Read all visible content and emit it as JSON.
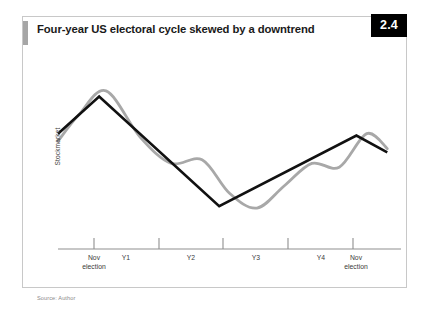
{
  "figure": {
    "number": "2.4",
    "title": "Four-year US electoral cycle skewed by a downtrend",
    "source": "Source: Author",
    "accent_color": "#a6a6a6",
    "badge_bg": "#000000",
    "badge_text_color": "#ffffff",
    "border_color": "#c8c8c8"
  },
  "chart_data": {
    "type": "line",
    "title": "Four-year US electoral cycle skewed by a downtrend",
    "xlabel": "",
    "ylabel": "Stockmarket",
    "grid": false,
    "legend": "none",
    "axis": {
      "x_axis_visible": true,
      "y_axis_visible": false,
      "tick_direction": "up",
      "tick_labels": [
        "Nov\nelection",
        "Y1",
        "Y2",
        "Y3",
        "Y4",
        "Nov\nelection"
      ],
      "tick_x_positions": [
        93,
        125,
        190,
        255,
        320,
        355
      ],
      "tick_mark_positions": [
        93,
        158,
        222,
        287,
        352
      ],
      "xlim": [
        0,
        100
      ],
      "ylim": [
        0,
        100
      ]
    },
    "series": [
      {
        "name": "Underlying trend",
        "color": "#111111",
        "width": 2.6,
        "style": "polyline",
        "x": [
          0,
          12,
          47,
          87,
          96
        ],
        "y": [
          62,
          82,
          23,
          61,
          52
        ]
      },
      {
        "name": "Electoral cycle",
        "color": "#a8a8a8",
        "width": 2.8,
        "style": "smooth-wave",
        "x": [
          0,
          6,
          14,
          24,
          33,
          42,
          50,
          58,
          66,
          74,
          82,
          90,
          96
        ],
        "y": [
          58,
          72,
          85,
          60,
          46,
          48,
          30,
          22,
          34,
          46,
          44,
          62,
          54
        ]
      }
    ],
    "annotations": []
  },
  "x_labels": [
    {
      "id": "nov-election-start",
      "text": "Nov\nelection",
      "left": 68,
      "width": 50
    },
    {
      "id": "y1",
      "text": "Y1",
      "left": 112,
      "width": 26
    },
    {
      "id": "y2",
      "text": "Y2",
      "left": 177,
      "width": 26
    },
    {
      "id": "y3",
      "text": "Y3",
      "left": 242,
      "width": 26
    },
    {
      "id": "y4",
      "text": "Y4",
      "left": 307,
      "width": 26
    },
    {
      "id": "nov-election-end",
      "text": "Nov\nelection",
      "left": 330,
      "width": 50
    }
  ]
}
